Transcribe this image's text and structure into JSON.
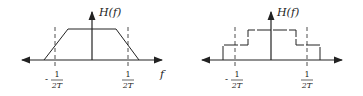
{
  "diagrams": [
    {
      "id": "trapezoid",
      "ylabel": "H(f)",
      "xlabel": "f",
      "tick_left": {
        "sign": "-",
        "num": "1",
        "den": "2T"
      },
      "tick_right": {
        "sign": "",
        "num": "1",
        "den": "2T"
      }
    },
    {
      "id": "staircase",
      "ylabel": "H(f)",
      "tick_left": {
        "sign": "-",
        "num": "1",
        "den": "2T"
      },
      "tick_right": {
        "sign": "",
        "num": "1",
        "den": "2T"
      }
    }
  ],
  "colors": {
    "stroke": "#222222",
    "background": "#ffffff"
  }
}
